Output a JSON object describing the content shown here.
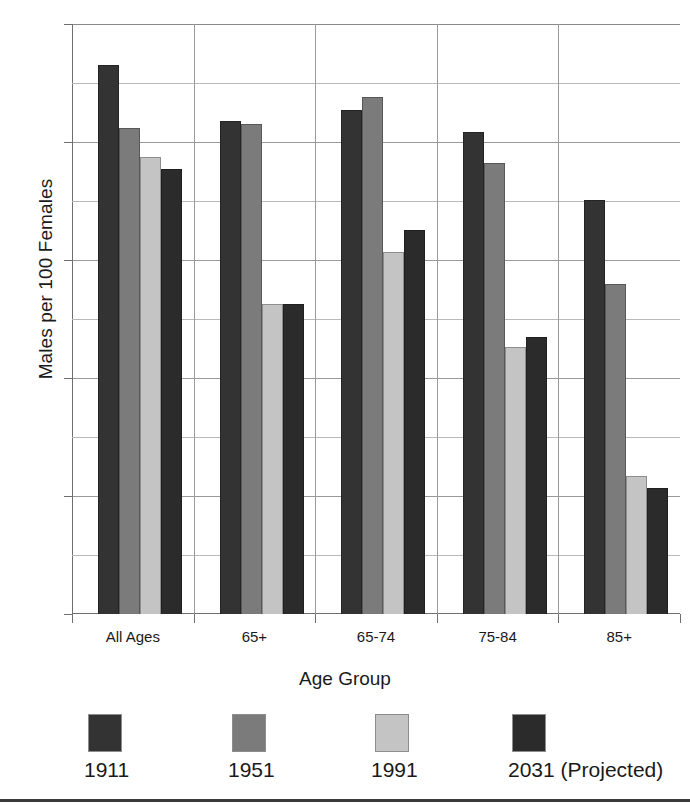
{
  "chart_data": {
    "type": "bar",
    "title": "",
    "xlabel": "Age Group",
    "ylabel": "Males per 100 Females",
    "categories": [
      "All Ages",
      "65+",
      "65-74",
      "75-84",
      "85+"
    ],
    "series": [
      {
        "name": "1911",
        "color": "#333333",
        "values": [
          113.0,
          103.5,
          105.5,
          101.7,
          90.2
        ]
      },
      {
        "name": "1951",
        "color": "#7b7b7b",
        "values": [
          102.4,
          103.0,
          107.7,
          96.4,
          76.0
        ]
      },
      {
        "name": "1991",
        "color": "#c4c4c4",
        "values": [
          97.4,
          72.5,
          81.4,
          65.3,
          43.4
        ]
      },
      {
        "name": "2031 (Projected)",
        "color": "#2b2b2b",
        "values": [
          95.5,
          72.5,
          85.1,
          67.0,
          41.3
        ]
      }
    ],
    "ylim": [
      20,
      120
    ],
    "ytick_labels": [
      "120",
      "100",
      "80",
      "60",
      "40",
      "20"
    ],
    "ytick_values": [
      120,
      100,
      80,
      60,
      40,
      20
    ],
    "minor_gridline_values": [
      110,
      90,
      70,
      50,
      30
    ],
    "grid": true,
    "legend_position": "bottom",
    "legend_entries": [
      "1911",
      "1951",
      "1991",
      "2031 (Projected)"
    ]
  }
}
